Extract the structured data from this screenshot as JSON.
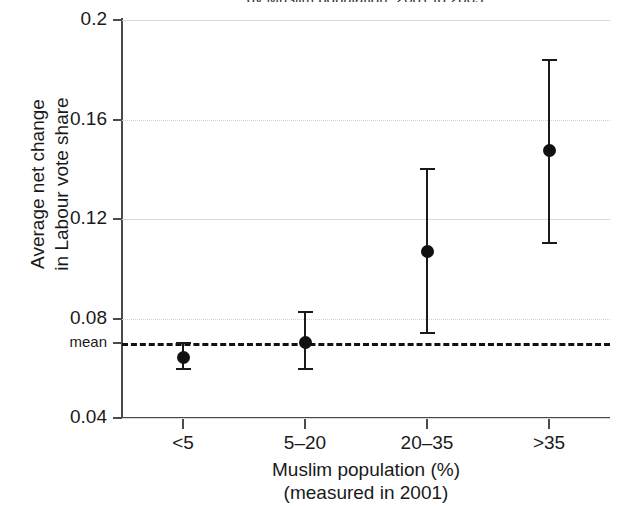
{
  "chart_data": {
    "type": "scatter",
    "title": "by Muslim population, 2001 to 2005",
    "categories": [
      "<5",
      "5–20",
      "20–35",
      ">35"
    ],
    "values": [
      0.0645,
      0.0705,
      0.107,
      0.1475
    ],
    "error_low": [
      0.0595,
      0.0595,
      0.074,
      0.1105
    ],
    "error_high": [
      0.07,
      0.0825,
      0.14,
      0.184
    ],
    "reference_line": {
      "label": "mean",
      "value": 0.07,
      "style": "dashed"
    },
    "xlabel": "Muslim population (%)",
    "xlabel_sub": "(measured in 2001)",
    "ylabel_line1": "Average net change",
    "ylabel_line2": "in Labour vote share",
    "ylim": [
      0.04,
      0.2
    ],
    "yticks": [
      0.2,
      0.16,
      0.12,
      0.08,
      0.04
    ],
    "ytick_labels": [
      "0.2",
      "0.16",
      "0.12",
      "0.08",
      "0.04"
    ],
    "grid": true,
    "legend": null,
    "marker_color": "#111111",
    "grid_color": "#d8d8d8",
    "axis_color": "#4a4a4a"
  }
}
